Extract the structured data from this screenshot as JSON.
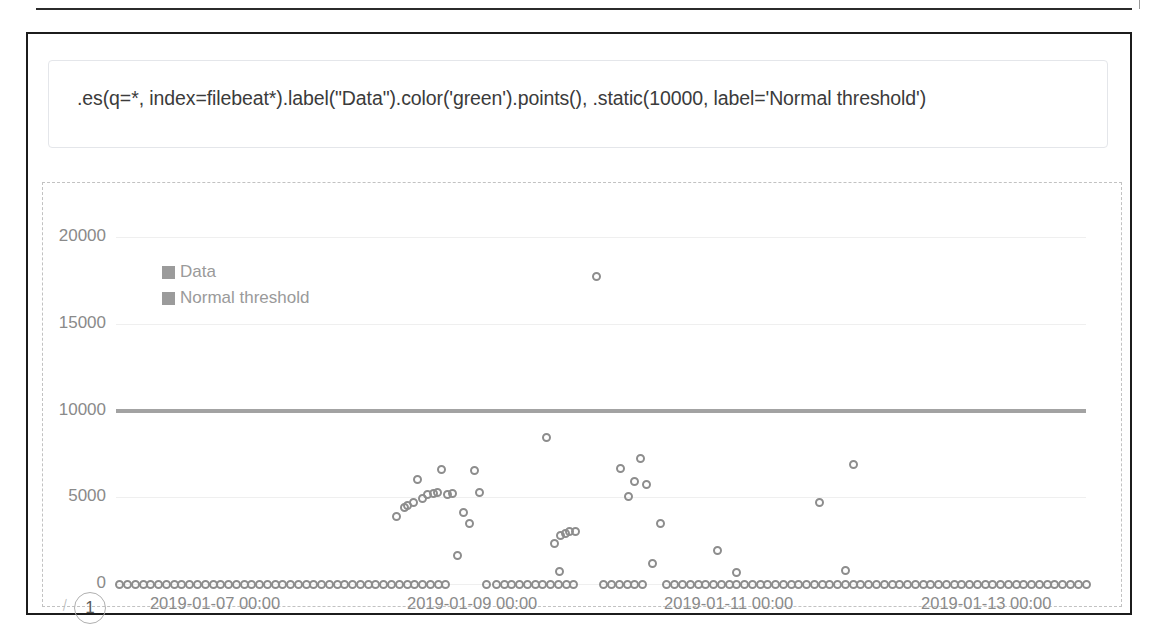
{
  "expression": {
    "value": ".es(q=*, index=filebeat*).label(\"Data\").color('green').points(), .static(10000, label='Normal threshold')",
    "placeholder": "Enter a timelion expression"
  },
  "callout": {
    "number": "1"
  },
  "legend": {
    "items": [
      {
        "label": "Data",
        "color": "#9b9b9b"
      },
      {
        "label": "Normal threshold",
        "color": "#9b9b9b"
      }
    ]
  },
  "chart_data": {
    "type": "scatter",
    "title": "",
    "xlabel": "",
    "ylabel": "",
    "grid": true,
    "legend_position": "top-left",
    "ylim": [
      0,
      20000
    ],
    "yticks": [
      0,
      5000,
      10000,
      15000,
      20000
    ],
    "ytick_labels": [
      "0",
      "5000",
      "10000",
      "15000",
      "20000"
    ],
    "xticks": [
      "2019-01-07 00:00",
      "2019-01-09 00:00",
      "2019-01-11 00:00",
      "2019-01-13 00:00"
    ],
    "xtick_labels": [
      "2019-01-07 00:00",
      "2019-01-09 00:00",
      "2019-01-11 00:00",
      "2019-01-13 00:00"
    ],
    "xlim": [
      "2019-01-06 12:00",
      "2019-01-14 00:00"
    ],
    "series": [
      {
        "name": "Data",
        "color": "#8d8d8d",
        "marker": "open-circle",
        "points": [
          [
            0.004,
            0
          ],
          [
            0.012,
            0
          ],
          [
            0.02,
            0
          ],
          [
            0.028,
            0
          ],
          [
            0.036,
            0
          ],
          [
            0.044,
            0
          ],
          [
            0.052,
            0
          ],
          [
            0.06,
            0
          ],
          [
            0.068,
            0
          ],
          [
            0.076,
            0
          ],
          [
            0.084,
            0
          ],
          [
            0.092,
            0
          ],
          [
            0.1,
            0
          ],
          [
            0.108,
            0
          ],
          [
            0.116,
            0
          ],
          [
            0.124,
            0
          ],
          [
            0.132,
            0
          ],
          [
            0.14,
            0
          ],
          [
            0.148,
            0
          ],
          [
            0.156,
            0
          ],
          [
            0.164,
            0
          ],
          [
            0.172,
            0
          ],
          [
            0.18,
            0
          ],
          [
            0.188,
            0
          ],
          [
            0.196,
            0
          ],
          [
            0.204,
            0
          ],
          [
            0.212,
            0
          ],
          [
            0.22,
            0
          ],
          [
            0.228,
            0
          ],
          [
            0.236,
            0
          ],
          [
            0.244,
            0
          ],
          [
            0.252,
            0
          ],
          [
            0.26,
            0
          ],
          [
            0.268,
            0
          ],
          [
            0.276,
            0
          ],
          [
            0.284,
            0
          ],
          [
            0.292,
            0
          ],
          [
            0.3,
            0
          ],
          [
            0.308,
            0
          ],
          [
            0.316,
            0
          ],
          [
            0.324,
            0
          ],
          [
            0.332,
            0
          ],
          [
            0.34,
            0
          ],
          [
            0.289,
            3900
          ],
          [
            0.297,
            4400
          ],
          [
            0.301,
            4550
          ],
          [
            0.307,
            4700
          ],
          [
            0.311,
            6050
          ],
          [
            0.316,
            4900
          ],
          [
            0.321,
            5150
          ],
          [
            0.327,
            5200
          ],
          [
            0.331,
            5250
          ],
          [
            0.336,
            6600
          ],
          [
            0.342,
            5150
          ],
          [
            0.347,
            5200
          ],
          [
            0.352,
            1650
          ],
          [
            0.358,
            4100
          ],
          [
            0.364,
            3500
          ],
          [
            0.37,
            6550
          ],
          [
            0.375,
            5300
          ],
          [
            0.382,
            0
          ],
          [
            0.392,
            0
          ],
          [
            0.4,
            0
          ],
          [
            0.408,
            0
          ],
          [
            0.416,
            0
          ],
          [
            0.424,
            0
          ],
          [
            0.432,
            0
          ],
          [
            0.44,
            0
          ],
          [
            0.448,
            0
          ],
          [
            0.456,
            0
          ],
          [
            0.464,
            0
          ],
          [
            0.472,
            0
          ],
          [
            0.444,
            8450
          ],
          [
            0.452,
            2350
          ],
          [
            0.458,
            2800
          ],
          [
            0.463,
            2900
          ],
          [
            0.468,
            3000
          ],
          [
            0.474,
            3050
          ],
          [
            0.457,
            700
          ],
          [
            0.495,
            17700
          ],
          [
            0.503,
            0
          ],
          [
            0.511,
            0
          ],
          [
            0.519,
            0
          ],
          [
            0.527,
            0
          ],
          [
            0.535,
            0
          ],
          [
            0.543,
            0
          ],
          [
            0.52,
            6650
          ],
          [
            0.528,
            5050
          ],
          [
            0.535,
            5900
          ],
          [
            0.541,
            7250
          ],
          [
            0.547,
            5750
          ],
          [
            0.553,
            1200
          ],
          [
            0.561,
            3500
          ],
          [
            0.568,
            0
          ],
          [
            0.576,
            0
          ],
          [
            0.584,
            0
          ],
          [
            0.592,
            0
          ],
          [
            0.6,
            0
          ],
          [
            0.608,
            0
          ],
          [
            0.616,
            0
          ],
          [
            0.624,
            0
          ],
          [
            0.632,
            0
          ],
          [
            0.64,
            0
          ],
          [
            0.62,
            1950
          ],
          [
            0.64,
            650
          ],
          [
            0.648,
            0
          ],
          [
            0.656,
            0
          ],
          [
            0.664,
            0
          ],
          [
            0.672,
            0
          ],
          [
            0.68,
            0
          ],
          [
            0.688,
            0
          ],
          [
            0.696,
            0
          ],
          [
            0.704,
            0
          ],
          [
            0.712,
            0
          ],
          [
            0.72,
            0
          ],
          [
            0.728,
            0
          ],
          [
            0.736,
            0
          ],
          [
            0.725,
            4700
          ],
          [
            0.76,
            6900
          ],
          [
            0.752,
            750
          ],
          [
            0.744,
            0
          ],
          [
            0.752,
            0
          ],
          [
            0.76,
            0
          ],
          [
            0.768,
            0
          ],
          [
            0.776,
            0
          ],
          [
            0.784,
            0
          ],
          [
            0.792,
            0
          ],
          [
            0.8,
            0
          ],
          [
            0.808,
            0
          ],
          [
            0.816,
            0
          ],
          [
            0.824,
            0
          ],
          [
            0.832,
            0
          ],
          [
            0.84,
            0
          ],
          [
            0.848,
            0
          ],
          [
            0.856,
            0
          ],
          [
            0.864,
            0
          ],
          [
            0.872,
            0
          ],
          [
            0.88,
            0
          ],
          [
            0.888,
            0
          ],
          [
            0.896,
            0
          ],
          [
            0.904,
            0
          ],
          [
            0.912,
            0
          ],
          [
            0.92,
            0
          ],
          [
            0.928,
            0
          ],
          [
            0.936,
            0
          ],
          [
            0.944,
            0
          ],
          [
            0.952,
            0
          ],
          [
            0.96,
            0
          ],
          [
            0.968,
            0
          ],
          [
            0.976,
            0
          ],
          [
            0.984,
            0
          ],
          [
            0.992,
            0
          ],
          [
            1.0,
            0
          ]
        ]
      },
      {
        "name": "Normal threshold",
        "color": "#9b9b9b",
        "marker": "line",
        "constant_value": 10000
      }
    ]
  }
}
